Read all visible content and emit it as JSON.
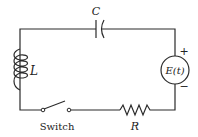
{
  "diagram": {
    "type": "series RLC circuit",
    "components": {
      "capacitor": {
        "label": "C"
      },
      "inductor": {
        "label": "L"
      },
      "resistor": {
        "label": "R"
      },
      "source": {
        "label": "E(t)",
        "plus": "+",
        "minus": "−"
      },
      "switch": {
        "label": "Switch",
        "state": "open"
      }
    },
    "colors": {
      "line": "#2a2a2a",
      "text": "#222222",
      "background": "#ffffff"
    }
  }
}
